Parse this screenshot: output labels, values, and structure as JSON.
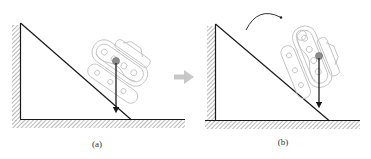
{
  "figure": {
    "panels": [
      {
        "id": "a",
        "caption": "(a)",
        "description": "Tracked robot resting on inclined slope; center of gravity projected downward falls within slope contact",
        "has_rotation_arrow": false
      },
      {
        "id": "b",
        "caption": "(b)",
        "description": "Tracked robot tipping over; center of gravity projected beyond slope, rotation arrow shows toppling direction",
        "has_rotation_arrow": true
      }
    ],
    "transition_arrow": "right-arrow-icon",
    "colors": {
      "line": "#1a1a1a",
      "hatch": "#8a8a8a",
      "robot_outline": "#bdbdbd",
      "cog_dot": "#8c8c8c",
      "transition_arrow": "#c8c8c8"
    }
  }
}
